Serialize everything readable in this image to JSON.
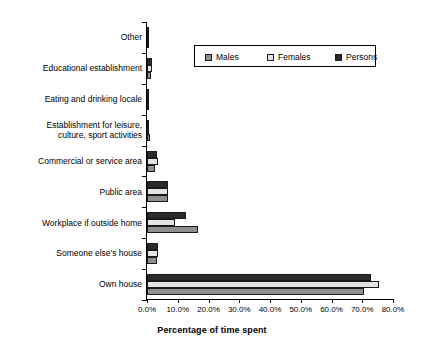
{
  "chart": {
    "xaxis_title": "Percentage of time spent",
    "tick_labels": [
      "0.0%",
      "10.0%",
      "20.0%",
      "30.0%",
      "40.0%",
      "50.0%",
      "60.0%",
      "70.0%",
      "80.0%"
    ]
  },
  "legend": {
    "items": [
      {
        "label": "Males",
        "color": "#8f8f8f",
        "icon": "legend-swatch-males"
      },
      {
        "label": "Females",
        "color": "#e3e3e3",
        "icon": "legend-swatch-females"
      },
      {
        "label": "Persons",
        "color": "#2b2b2b",
        "icon": "legend-swatch-persons"
      }
    ]
  },
  "categories_display": [
    "Other",
    "Educational establishment",
    "Eating and drinking locale",
    "Establishment for leisure,\nculture, sport activities",
    "Commercial or service area",
    "Public area",
    "Workplace if outside home",
    "Someone else's house",
    "Own house"
  ],
  "chart_data": {
    "type": "bar",
    "orientation": "horizontal",
    "title": "",
    "xlabel": "Percentage of time spent",
    "ylabel": "",
    "xlim": [
      0,
      80
    ],
    "xtick_values": [
      0,
      10,
      20,
      30,
      40,
      50,
      60,
      70,
      80
    ],
    "xtick_labels": [
      "0.0%",
      "10.0%",
      "20.0%",
      "30.0%",
      "40.0%",
      "50.0%",
      "60.0%",
      "70.0%",
      "80.0%"
    ],
    "grid": false,
    "legend_position": "upper center",
    "categories": [
      "Other",
      "Educational establishment",
      "Eating and drinking locale",
      "Establishment for leisure, culture, sport activities",
      "Commercial or service area",
      "Public area",
      "Workplace if outside home",
      "Someone else's house",
      "Own house"
    ],
    "series": [
      {
        "name": "Persons",
        "color": "#2b2b2b",
        "values": [
          0.5,
          1.5,
          0.7,
          0.8,
          3.2,
          6.8,
          12.7,
          3.5,
          72.7
        ]
      },
      {
        "name": "Females",
        "color": "#e3e3e3",
        "values": [
          0.4,
          1.5,
          0.5,
          0.7,
          3.5,
          6.8,
          9.1,
          3.7,
          75.3
        ]
      },
      {
        "name": "Males",
        "color": "#8f8f8f",
        "values": [
          0.6,
          1.4,
          0.8,
          0.9,
          2.6,
          6.8,
          16.6,
          3.3,
          70.5
        ]
      }
    ]
  }
}
